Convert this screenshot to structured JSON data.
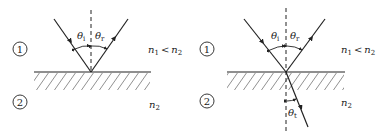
{
  "diagram": {
    "panels": [
      {
        "id": "left",
        "description": "Reflection only",
        "medium_top_label": "1",
        "medium_bottom_label": "2",
        "relation_label_n1": "n",
        "relation_sub_1": "1",
        "relation_op": "<",
        "relation_label_n2": "n",
        "relation_sub_2": "2",
        "bottom_index_label": "n",
        "bottom_index_sub": "2",
        "angle_incident": "θ",
        "angle_incident_sub": "i",
        "angle_reflected": "θ",
        "angle_reflected_sub": "r"
      },
      {
        "id": "right",
        "description": "Reflection and refraction",
        "medium_top_label": "1",
        "medium_bottom_label": "2",
        "relation_label_n1": "n",
        "relation_sub_1": "1",
        "relation_op": "<",
        "relation_label_n2": "n",
        "relation_sub_2": "2",
        "bottom_index_label": "n",
        "bottom_index_sub": "2",
        "angle_incident": "θ",
        "angle_incident_sub": "i",
        "angle_reflected": "θ",
        "angle_reflected_sub": "r",
        "angle_transmitted": "θ",
        "angle_transmitted_sub": "t"
      }
    ],
    "colors": {
      "ink": "#222222",
      "background": "#ffffff"
    }
  }
}
